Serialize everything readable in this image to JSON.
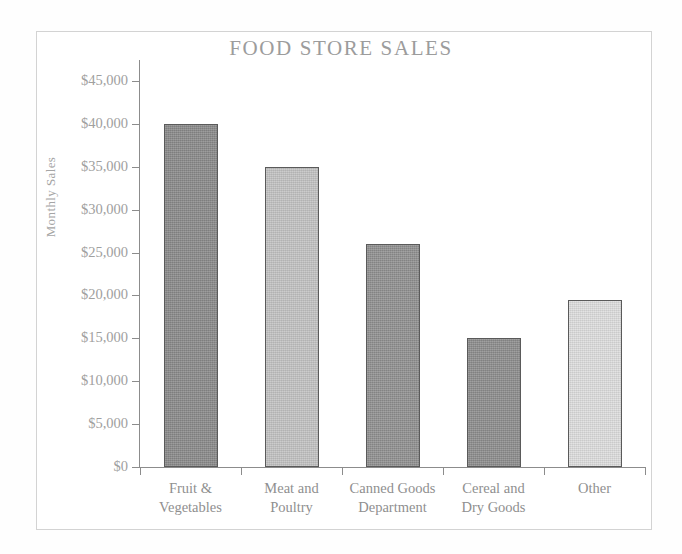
{
  "chart_data": {
    "type": "bar",
    "title": "FOOD STORE SALES",
    "xlabel": "",
    "ylabel": "Monthly Sales",
    "categories": [
      "Fruit & Vegetables",
      "Meat and Poultry",
      "Canned Goods Department",
      "Cereal and Dry Goods",
      "Other"
    ],
    "category_lines": [
      [
        "Fruit &",
        "Vegetables"
      ],
      [
        "Meat and",
        "Poultry"
      ],
      [
        "Canned Goods",
        "Department"
      ],
      [
        "Cereal and",
        "Dry Goods"
      ],
      [
        "Other",
        ""
      ]
    ],
    "values": [
      40000,
      35000,
      26000,
      15000,
      19500
    ],
    "bar_colors": [
      "#8a8a8a",
      "#c2c2c2",
      "#909090",
      "#8d8d8d",
      "#dedede"
    ],
    "bar_outline": "#5a5a5a",
    "ylim": [
      0,
      45000
    ],
    "ytick_values": [
      0,
      5000,
      10000,
      15000,
      20000,
      25000,
      30000,
      35000,
      40000,
      45000
    ],
    "ytick_labels": [
      "$0",
      "$5,000",
      "$10,000",
      "$15,000",
      "$20,000",
      "$25,000",
      "$30,000",
      "$35,000",
      "$40,000",
      "$45,000"
    ],
    "grid": false,
    "legend": false,
    "title_color": "#9c9c9c",
    "axis_color": "#8c8c8c",
    "label_color": "#a0a0a0"
  }
}
